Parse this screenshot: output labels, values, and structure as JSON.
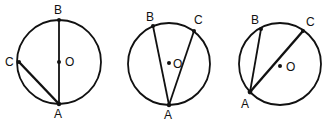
{
  "diagrams": [
    {
      "name": "diagram-1",
      "circle": {
        "cx": 59,
        "cy": 62,
        "r": 42
      },
      "center": {
        "label": "O",
        "x": 59,
        "y": 62,
        "lx": 65,
        "ly": 66
      },
      "points": {
        "A": {
          "label": "A",
          "x": 59,
          "y": 104,
          "lx": 54,
          "ly": 118
        },
        "B": {
          "label": "B",
          "x": 59,
          "y": 20,
          "lx": 54,
          "ly": 14
        },
        "C": {
          "label": "C",
          "x": 19,
          "y": 62,
          "lx": 5,
          "ly": 66
        }
      },
      "chords": [
        "A-B",
        "A-C"
      ]
    },
    {
      "name": "diagram-2",
      "circle": {
        "cx": 169,
        "cy": 64,
        "r": 41
      },
      "center": {
        "label": "O",
        "x": 169,
        "y": 63,
        "lx": 173,
        "ly": 68
      },
      "points": {
        "A": {
          "label": "A",
          "x": 169,
          "y": 105,
          "lx": 164,
          "ly": 119
        },
        "B": {
          "label": "B",
          "x": 153,
          "y": 26,
          "lx": 146,
          "ly": 21
        },
        "C": {
          "label": "C",
          "x": 194,
          "y": 31,
          "lx": 194,
          "ly": 24
        }
      },
      "chords": [
        "A-B",
        "A-C"
      ]
    },
    {
      "name": "diagram-3",
      "circle": {
        "cx": 280,
        "cy": 64,
        "r": 41
      },
      "center": {
        "label": "O",
        "x": 280,
        "y": 66,
        "lx": 286,
        "ly": 71
      },
      "points": {
        "A": {
          "label": "A",
          "x": 250,
          "y": 92,
          "lx": 241,
          "ly": 108
        },
        "B": {
          "label": "B",
          "x": 261,
          "y": 29,
          "lx": 251,
          "ly": 24
        },
        "C": {
          "label": "C",
          "x": 303,
          "y": 31,
          "lx": 306,
          "ly": 26
        }
      },
      "chords": [
        "A-B",
        "A-C"
      ]
    }
  ]
}
